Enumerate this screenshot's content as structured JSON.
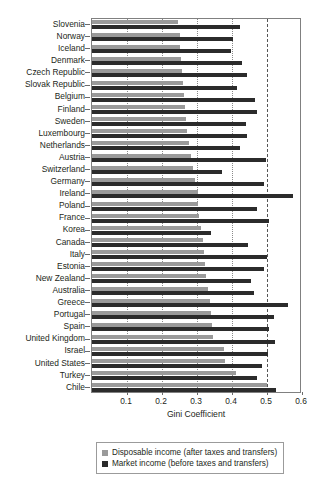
{
  "chart_data": {
    "type": "bar",
    "orientation": "horizontal",
    "title": "",
    "xlabel": "Gini Coefficient",
    "ylabel": "",
    "xlim": [
      0,
      0.6
    ],
    "xticks": [
      "0.1",
      "0.2",
      "0.3",
      "0.4",
      "0.5",
      "0.6"
    ],
    "xtick_values": [
      0.1,
      0.2,
      0.3,
      0.4,
      0.5,
      0.6
    ],
    "grid": "vertical dotted gridlines at each 0.1 tick; emphasized dashed line at 0.5",
    "legend_position": "below axis, centered, boxed",
    "categories": [
      "Slovenia",
      "Norway",
      "Iceland",
      "Denmark",
      "Czech Republic",
      "Slovak Republic",
      "Belgium",
      "Finland",
      "Sweden",
      "Luxembourg",
      "Netherlands",
      "Austria",
      "Switzerland",
      "Germany",
      "Ireland",
      "Poland",
      "France",
      "Korea",
      "Canada",
      "Italy",
      "Estonia",
      "New Zealand",
      "Australia",
      "Greece",
      "Portugal",
      "Spain",
      "United Kingdom",
      "Israel",
      "United States",
      "Turkey",
      "Chile"
    ],
    "series": [
      {
        "name": "Disposable income (after taxes and transfers)",
        "color": "#9a9a9a",
        "values": [
          0.245,
          0.25,
          0.252,
          0.253,
          0.256,
          0.261,
          0.264,
          0.265,
          0.269,
          0.272,
          0.278,
          0.282,
          0.289,
          0.293,
          0.302,
          0.304,
          0.306,
          0.31,
          0.316,
          0.321,
          0.323,
          0.326,
          0.33,
          0.337,
          0.341,
          0.344,
          0.345,
          0.376,
          0.38,
          0.411,
          0.501
        ]
      },
      {
        "name": "Market income (before taxes and transfers)",
        "color": "#2b2b2b",
        "values": [
          0.424,
          0.404,
          0.396,
          0.429,
          0.444,
          0.414,
          0.466,
          0.472,
          0.441,
          0.442,
          0.424,
          0.496,
          0.372,
          0.492,
          0.574,
          0.47,
          0.505,
          0.341,
          0.447,
          0.499,
          0.492,
          0.455,
          0.464,
          0.56,
          0.521,
          0.507,
          0.523,
          0.502,
          0.486,
          0.47,
          0.527
        ]
      }
    ]
  },
  "axis": {
    "xlabel": "Gini Coefficient"
  },
  "legend": {
    "items": [
      {
        "label": "Disposable income (after taxes and transfers)",
        "swatch": "disposable"
      },
      {
        "label": "Market income (before taxes and transfers)",
        "swatch": "market"
      }
    ]
  }
}
